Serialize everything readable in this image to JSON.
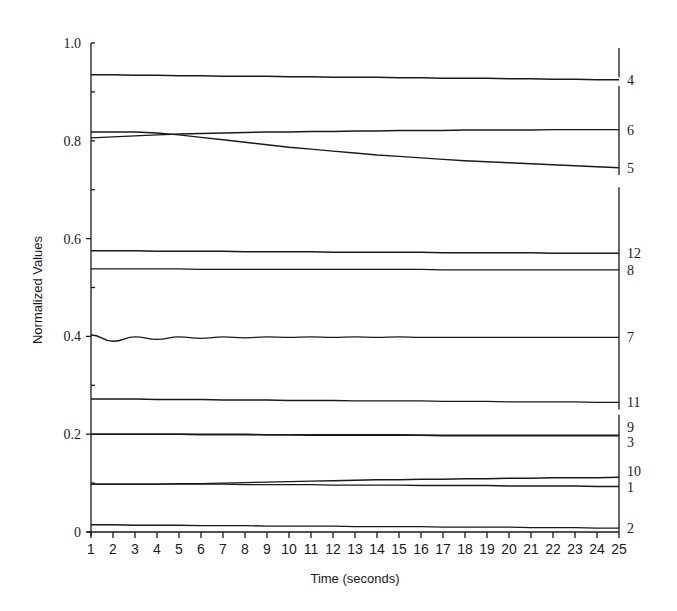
{
  "chart_data": {
    "type": "line",
    "title": "",
    "xlabel": "Time (seconds)",
    "ylabel": "Normalized Values",
    "xlim": [
      1,
      25
    ],
    "ylim": [
      0,
      1.0
    ],
    "grid": false,
    "legend_position": "right-edge inline labels",
    "x": [
      1,
      2,
      3,
      4,
      5,
      6,
      7,
      8,
      9,
      10,
      11,
      12,
      13,
      14,
      15,
      16,
      17,
      18,
      19,
      20,
      21,
      22,
      23,
      24,
      25
    ],
    "x_ticks": [
      "1",
      "2",
      "3",
      "4",
      "5",
      "6",
      "7",
      "8",
      "9",
      "10",
      "11",
      "12",
      "13",
      "14",
      "15",
      "16",
      "17",
      "18",
      "19",
      "20",
      "21",
      "22",
      "23",
      "24",
      "25"
    ],
    "y_ticks": [
      {
        "value": 0,
        "label": "0"
      },
      {
        "value": 0.2,
        "label": "0.2"
      },
      {
        "value": 0.4,
        "label": "0.4"
      },
      {
        "value": 0.6,
        "label": "0.6"
      },
      {
        "value": 0.8,
        "label": "0.8"
      },
      {
        "value": 1.0,
        "label": "1.0"
      }
    ],
    "series": [
      {
        "name": "4",
        "values": [
          0.935,
          0.935,
          0.934,
          0.934,
          0.933,
          0.933,
          0.932,
          0.932,
          0.932,
          0.931,
          0.931,
          0.93,
          0.93,
          0.93,
          0.929,
          0.929,
          0.928,
          0.928,
          0.928,
          0.927,
          0.927,
          0.926,
          0.926,
          0.925,
          0.925
        ]
      },
      {
        "name": "6",
        "values": [
          0.806,
          0.808,
          0.81,
          0.812,
          0.814,
          0.815,
          0.816,
          0.817,
          0.818,
          0.818,
          0.819,
          0.819,
          0.82,
          0.82,
          0.821,
          0.821,
          0.821,
          0.822,
          0.822,
          0.822,
          0.822,
          0.823,
          0.823,
          0.823,
          0.823
        ]
      },
      {
        "name": "5",
        "values": [
          0.818,
          0.818,
          0.818,
          0.816,
          0.812,
          0.807,
          0.802,
          0.797,
          0.792,
          0.787,
          0.783,
          0.779,
          0.775,
          0.771,
          0.768,
          0.765,
          0.762,
          0.759,
          0.757,
          0.755,
          0.753,
          0.751,
          0.749,
          0.747,
          0.745
        ]
      },
      {
        "name": "12",
        "values": [
          0.575,
          0.575,
          0.575,
          0.574,
          0.574,
          0.574,
          0.574,
          0.573,
          0.573,
          0.573,
          0.573,
          0.572,
          0.572,
          0.572,
          0.572,
          0.572,
          0.571,
          0.571,
          0.571,
          0.571,
          0.571,
          0.57,
          0.57,
          0.57,
          0.57
        ]
      },
      {
        "name": "8",
        "values": [
          0.538,
          0.538,
          0.538,
          0.538,
          0.538,
          0.537,
          0.537,
          0.537,
          0.537,
          0.537,
          0.537,
          0.537,
          0.537,
          0.537,
          0.537,
          0.537,
          0.536,
          0.536,
          0.536,
          0.536,
          0.536,
          0.536,
          0.536,
          0.536,
          0.536
        ]
      },
      {
        "name": "7",
        "values": [
          0.403,
          0.39,
          0.399,
          0.394,
          0.399,
          0.396,
          0.399,
          0.397,
          0.399,
          0.398,
          0.399,
          0.398,
          0.399,
          0.398,
          0.399,
          0.398,
          0.398,
          0.398,
          0.398,
          0.398,
          0.398,
          0.398,
          0.398,
          0.398,
          0.398
        ]
      },
      {
        "name": "11",
        "values": [
          0.272,
          0.272,
          0.272,
          0.271,
          0.271,
          0.271,
          0.27,
          0.27,
          0.27,
          0.269,
          0.269,
          0.269,
          0.268,
          0.268,
          0.268,
          0.268,
          0.267,
          0.267,
          0.267,
          0.266,
          0.266,
          0.266,
          0.266,
          0.265,
          0.265
        ]
      },
      {
        "name": "9",
        "values": [
          0.2,
          0.2,
          0.2,
          0.2,
          0.2,
          0.2,
          0.2,
          0.2,
          0.199,
          0.199,
          0.199,
          0.199,
          0.199,
          0.199,
          0.199,
          0.198,
          0.198,
          0.198,
          0.198,
          0.198,
          0.198,
          0.198,
          0.198,
          0.198,
          0.198
        ]
      },
      {
        "name": "3",
        "values": [
          0.2,
          0.2,
          0.2,
          0.2,
          0.2,
          0.199,
          0.199,
          0.199,
          0.199,
          0.199,
          0.198,
          0.198,
          0.198,
          0.198,
          0.198,
          0.198,
          0.197,
          0.197,
          0.197,
          0.197,
          0.197,
          0.197,
          0.197,
          0.197,
          0.197
        ]
      },
      {
        "name": "10",
        "values": [
          0.098,
          0.098,
          0.098,
          0.098,
          0.099,
          0.099,
          0.1,
          0.101,
          0.102,
          0.103,
          0.104,
          0.105,
          0.106,
          0.107,
          0.107,
          0.108,
          0.108,
          0.109,
          0.109,
          0.11,
          0.11,
          0.111,
          0.111,
          0.111,
          0.112
        ]
      },
      {
        "name": "1",
        "values": [
          0.098,
          0.098,
          0.098,
          0.098,
          0.098,
          0.098,
          0.098,
          0.097,
          0.097,
          0.097,
          0.097,
          0.096,
          0.096,
          0.096,
          0.096,
          0.095,
          0.095,
          0.095,
          0.095,
          0.094,
          0.094,
          0.094,
          0.094,
          0.093,
          0.093
        ]
      },
      {
        "name": "2",
        "values": [
          0.015,
          0.015,
          0.014,
          0.014,
          0.014,
          0.013,
          0.013,
          0.013,
          0.012,
          0.012,
          0.012,
          0.012,
          0.011,
          0.011,
          0.011,
          0.011,
          0.01,
          0.01,
          0.01,
          0.01,
          0.009,
          0.009,
          0.009,
          0.008,
          0.008
        ]
      }
    ],
    "right_labels": [
      {
        "label": "4",
        "y": 0.925
      },
      {
        "label": "6",
        "y": 0.823
      },
      {
        "label": "5",
        "y": 0.745
      },
      {
        "label": "12",
        "y": 0.57
      },
      {
        "label": "8",
        "y": 0.536
      },
      {
        "label": "7",
        "y": 0.398
      },
      {
        "label": "11",
        "y": 0.265
      },
      {
        "label": "9",
        "y": 0.214
      },
      {
        "label": "3",
        "y": 0.185
      },
      {
        "label": "10",
        "y": 0.124
      },
      {
        "label": "1",
        "y": 0.093
      },
      {
        "label": "2",
        "y": 0.008
      }
    ]
  }
}
